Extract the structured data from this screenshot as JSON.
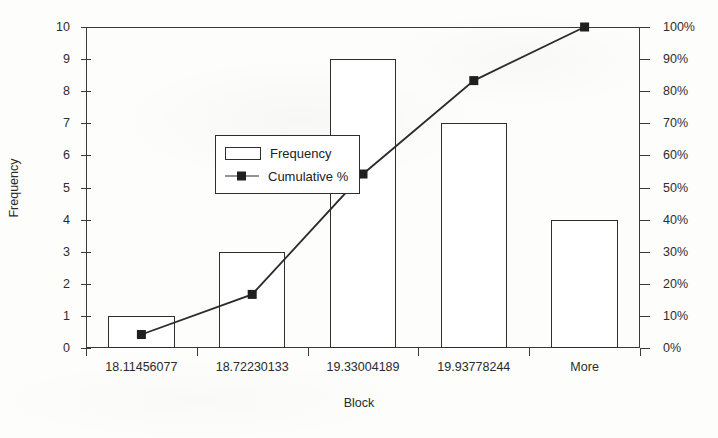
{
  "chart_data": {
    "type": "bar",
    "title": "",
    "xlabel": "Block",
    "ylabel": "Frequency",
    "y2label": "",
    "categories": [
      "18.11456077",
      "18.72230133",
      "19.33004189",
      "19.93778244",
      "More"
    ],
    "series": [
      {
        "name": "Frequency",
        "type": "bar",
        "values": [
          1,
          3,
          9,
          7,
          4
        ],
        "axis": "left"
      },
      {
        "name": "Cumulative %",
        "type": "line",
        "values": [
          4.2,
          16.7,
          54.2,
          83.3,
          100.0
        ],
        "axis": "right"
      }
    ],
    "ylim": [
      0,
      10
    ],
    "ytick_labels": [
      "10",
      "9",
      "8",
      "7",
      "6",
      "5",
      "4",
      "3",
      "2",
      "1",
      "0"
    ],
    "ytick_values": [
      10,
      9,
      8,
      7,
      6,
      5,
      4,
      3,
      2,
      1,
      0
    ],
    "y2lim": [
      0,
      100
    ],
    "y2tick_labels": [
      "100%",
      "90%",
      "80%",
      "70%",
      "60%",
      "50%",
      "40%",
      "30%",
      "20%",
      "10%",
      "0%"
    ],
    "y2tick_values": [
      100,
      90,
      80,
      70,
      60,
      50,
      40,
      30,
      20,
      10,
      0
    ],
    "grid": false,
    "legend_position": "inside-upper-left",
    "bar_fill": "#ffffff",
    "bar_edge": "#2e2e2e",
    "line_color": "#2b2b2b",
    "marker": "square-filled"
  },
  "legend": {
    "items": [
      {
        "label": "Frequency",
        "swatch": "hollow-rect"
      },
      {
        "label": "Cumulative %",
        "swatch": "line-square-marker"
      }
    ]
  },
  "axes": {
    "x_title": "Block",
    "y_title": "Frequency"
  }
}
